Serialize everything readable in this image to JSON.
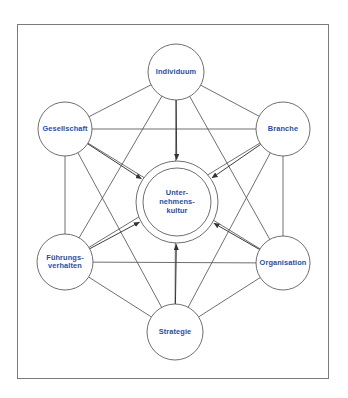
{
  "diagram": {
    "title_text": "",
    "frame": {
      "x": 17,
      "y": 24,
      "width": 311,
      "height": 354,
      "border_color": "#7a7a7a",
      "background_color": "#ffffff"
    },
    "style": {
      "node_stroke_color": "#555555",
      "link_color": "#555555",
      "text_color": "#2b4ea2",
      "arrow_color": "#333333"
    },
    "center_node": {
      "name": "unternehmenskultur",
      "label_lines": [
        "Unter-",
        "nehmens-",
        "kultur"
      ],
      "cx": 177,
      "cy": 202,
      "r_outer": 41,
      "r_inner": 34
    },
    "nodes": [
      {
        "name": "individuum",
        "label_lines": [
          "Individuum"
        ],
        "cx": 176,
        "cy": 72,
        "r": 28
      },
      {
        "name": "branche",
        "label_lines": [
          "Branche"
        ],
        "cx": 283,
        "cy": 129,
        "r": 27
      },
      {
        "name": "organisation",
        "label_lines": [
          "Organisation"
        ],
        "cx": 283,
        "cy": 263,
        "r": 27
      },
      {
        "name": "strategie",
        "label_lines": [
          "Strategie"
        ],
        "cx": 175,
        "cy": 332,
        "r": 28
      },
      {
        "name": "fuehrungsverhalten",
        "label_lines": [
          "Führungs-",
          "verhalten"
        ],
        "cx": 65,
        "cy": 262,
        "r": 28
      },
      {
        "name": "gesellschaft",
        "label_lines": [
          "Gesellschaft"
        ],
        "cx": 65,
        "cy": 129,
        "r": 27
      }
    ],
    "ring_links": [
      {
        "from": "individuum",
        "to": "branche"
      },
      {
        "from": "branche",
        "to": "organisation"
      },
      {
        "from": "organisation",
        "to": "strategie"
      },
      {
        "from": "strategie",
        "to": "fuehrungsverhalten"
      },
      {
        "from": "fuehrungsverhalten",
        "to": "gesellschaft"
      },
      {
        "from": "gesellschaft",
        "to": "individuum"
      }
    ],
    "chord_links": [
      {
        "from": "individuum",
        "to": "organisation"
      },
      {
        "from": "individuum",
        "to": "fuehrungsverhalten"
      },
      {
        "from": "branche",
        "to": "strategie"
      },
      {
        "from": "branche",
        "to": "fuehrungsverhalten"
      },
      {
        "from": "organisation",
        "to": "gesellschaft"
      },
      {
        "from": "strategie",
        "to": "gesellschaft"
      },
      {
        "from": "gesellschaft",
        "to": "branche"
      },
      {
        "from": "individuum",
        "to": "strategie"
      },
      {
        "from": "fuehrungsverhalten",
        "to": "organisation"
      }
    ],
    "center_arrows": [
      {
        "from": "individuum"
      },
      {
        "from": "branche"
      },
      {
        "from": "organisation"
      },
      {
        "from": "strategie"
      },
      {
        "from": "fuehrungsverhalten"
      },
      {
        "from": "gesellschaft"
      }
    ]
  }
}
